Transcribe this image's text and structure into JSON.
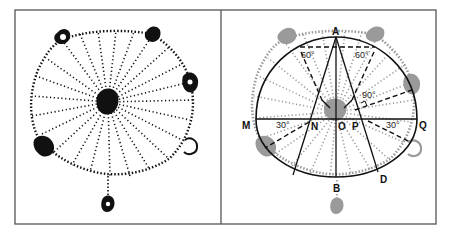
{
  "figure": {
    "panels": [
      {
        "id": "left",
        "description": "radial dotted pattern (spider web / dandelion style) with blobs at rim"
      },
      {
        "id": "right",
        "description": "same pattern in gray with geometric construction overlay"
      }
    ],
    "colors": {
      "frame": "#555555",
      "left_dots": "#111111",
      "right_dots": "#9a9a9a",
      "construction": "#111111"
    }
  },
  "labels": {
    "A": "A",
    "B": "B",
    "D": "D",
    "M": "M",
    "N": "N",
    "O": "O",
    "P": "P",
    "Q": "Q"
  },
  "angles": {
    "top_left": "60°",
    "top_right": "60°",
    "right_mid": "90°",
    "bottom_left": "30°",
    "bottom_right": "30°"
  }
}
